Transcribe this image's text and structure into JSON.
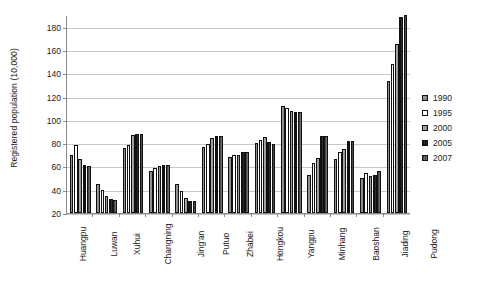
{
  "chart_data": {
    "type": "bar",
    "title": "",
    "xlabel": "",
    "ylabel": "Registered population (10,000)",
    "ylim": [
      20,
      190
    ],
    "yticks": [
      20,
      40,
      60,
      80,
      100,
      120,
      140,
      160,
      180
    ],
    "grid": true,
    "legend_position": "right",
    "categories": [
      "Huangpu",
      "Luwan",
      "Xuhui",
      "Changning",
      "Jing'an",
      "Putuo",
      "Zhabei",
      "Hongkou",
      "Yangpu",
      "Minhang",
      "Baoshan",
      "Jiading",
      "Pudong"
    ],
    "series": [
      {
        "name": "1990",
        "color": "#8f8f8f",
        "values": [
          70,
          45,
          76,
          56,
          45,
          77,
          68,
          80,
          112,
          53,
          66,
          50,
          133
        ]
      },
      {
        "name": "1995",
        "color": "#ffffff",
        "values": [
          78,
          40,
          78,
          59,
          39,
          79,
          70,
          83,
          110,
          63,
          72,
          54,
          148
        ]
      },
      {
        "name": "2000",
        "color": "#a8a8a8",
        "values": [
          66,
          35,
          87,
          60,
          33,
          84,
          70,
          85,
          108,
          67,
          75,
          52,
          165
        ]
      },
      {
        "name": "2005",
        "color": "#111111",
        "values": [
          61,
          32,
          88,
          61,
          30,
          86,
          72,
          81,
          107,
          86,
          82,
          53,
          188
        ]
      },
      {
        "name": "2007",
        "color": "#555555",
        "values": [
          60,
          31,
          88,
          61,
          30,
          86,
          72,
          79,
          107,
          86,
          82,
          56,
          190
        ]
      }
    ]
  },
  "legend": {
    "items": [
      {
        "label": "1990"
      },
      {
        "label": "1995"
      },
      {
        "label": "2000"
      },
      {
        "label": "2005"
      },
      {
        "label": "2007"
      }
    ]
  }
}
